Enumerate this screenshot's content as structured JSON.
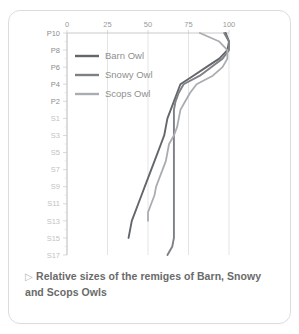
{
  "caption": {
    "marker": "▷",
    "text": "Relative sizes of the remiges of Barn, Snowy and Scops Owls"
  },
  "chart_data": {
    "type": "line",
    "title": "Relative sizes of the remiges of Barn, Snowy and Scops Owls",
    "orientation": "horizontal-categories-on-y",
    "xlabel": "",
    "ylabel": "",
    "xlim": [
      0,
      100
    ],
    "xticks": [
      0,
      25,
      50,
      75,
      100
    ],
    "xtick_labels": [
      "0",
      "25",
      "50",
      "75",
      "100"
    ],
    "grid": true,
    "grid_axis": "x",
    "legend_position": "top-left-inside",
    "categories": [
      "P10",
      "P9",
      "P8",
      "P7",
      "P6",
      "P5",
      "P4",
      "P3",
      "P2",
      "P1",
      "S1",
      "S2",
      "S3",
      "S4",
      "S5",
      "S6",
      "S7",
      "S8",
      "S9",
      "S10",
      "S11",
      "S12",
      "S13",
      "S14",
      "S15",
      "S16",
      "S17"
    ],
    "ytick_labels_shown": [
      "P10",
      "P8",
      "P6",
      "P4",
      "P2",
      "S1",
      "S3",
      "S5",
      "S7",
      "S9",
      "S11",
      "S13",
      "S15",
      "S17"
    ],
    "series": [
      {
        "name": "Barn Owl",
        "color": "#63666b",
        "values": [
          98,
          100,
          99,
          94,
          86,
          78,
          70,
          68,
          66,
          64,
          62,
          61,
          60,
          58,
          56,
          54,
          52,
          50,
          48,
          46,
          44,
          42,
          40,
          39,
          38,
          null,
          null
        ]
      },
      {
        "name": "Snowy Owl",
        "color": "#7d8085",
        "values": [
          97,
          100,
          100,
          96,
          89,
          82,
          72,
          69,
          67,
          66,
          66,
          66,
          66,
          66,
          66,
          66,
          66,
          66,
          66,
          66,
          66,
          66,
          66,
          66,
          66,
          65,
          62
        ]
      },
      {
        "name": "Scops Owl",
        "color": "#a9adb2",
        "values": [
          82,
          94,
          99,
          99,
          96,
          90,
          80,
          76,
          73,
          70,
          69,
          68,
          66,
          63,
          62,
          61,
          59,
          57,
          55,
          54,
          52,
          50,
          50,
          null,
          null,
          null,
          null
        ]
      }
    ]
  },
  "legend": {
    "items": [
      {
        "label": "Barn Owl",
        "color": "#63666b"
      },
      {
        "label": "Snowy Owl",
        "color": "#7d8085"
      },
      {
        "label": "Scops Owl",
        "color": "#a9adb2"
      }
    ]
  }
}
